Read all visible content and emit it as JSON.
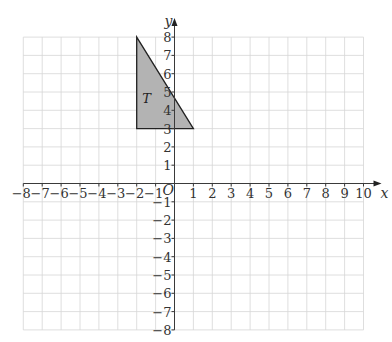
{
  "diagram": {
    "type": "coordinate-grid",
    "axes": {
      "x": {
        "label": "x",
        "min": -8,
        "max": 10,
        "tick_labels": [
          "-8",
          "-7",
          "-6",
          "-5",
          "-4",
          "-3",
          "-2",
          "-1",
          "1",
          "2",
          "3",
          "4",
          "5",
          "6",
          "7",
          "8",
          "9",
          "10"
        ]
      },
      "y": {
        "label": "y",
        "min": -8,
        "max": 8,
        "tick_labels": [
          "-8",
          "-7",
          "-6",
          "-5",
          "-4",
          "-3",
          "-2",
          "-1",
          "1",
          "2",
          "3",
          "4",
          "5",
          "6",
          "7",
          "8"
        ]
      },
      "origin_label": "O"
    },
    "grid": {
      "x_from": -8,
      "x_to": 10,
      "y_from": -8,
      "y_to": 8,
      "step": 1
    },
    "shapes": [
      {
        "name": "T",
        "label": "T",
        "type": "triangle",
        "vertices": [
          [
            -2,
            8
          ],
          [
            -2,
            3
          ],
          [
            1,
            3
          ]
        ],
        "fill": "#b3b3b3",
        "stroke": "#222222",
        "label_position": [
          -1.7,
          4.4
        ]
      }
    ]
  },
  "colors": {
    "grid": "#d6d6d6",
    "axis": "#3a3a3a",
    "shape_fill": "#b3b3b3"
  }
}
